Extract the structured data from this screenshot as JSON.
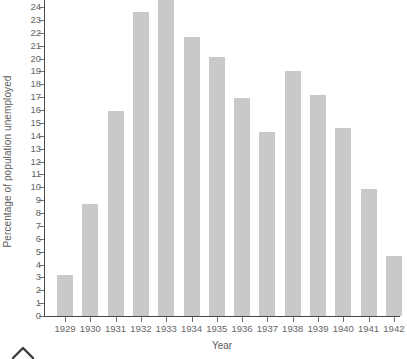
{
  "chart_data": {
    "type": "bar",
    "title": "",
    "xlabel": "Year",
    "ylabel": "Percentage of population unemployed",
    "categories": [
      "1929",
      "1930",
      "1931",
      "1932",
      "1933",
      "1934",
      "1935",
      "1936",
      "1937",
      "1938",
      "1939",
      "1940",
      "1941",
      "1942"
    ],
    "values": [
      3.2,
      8.7,
      15.9,
      23.6,
      24.9,
      21.7,
      20.1,
      16.9,
      14.3,
      19.0,
      17.2,
      14.6,
      9.9,
      4.7
    ],
    "ylim": [
      0,
      24
    ],
    "y_ticks": [
      0,
      1,
      2,
      3,
      4,
      5,
      6,
      7,
      8,
      9,
      10,
      11,
      12,
      13,
      14,
      15,
      16,
      17,
      18,
      19,
      20,
      21,
      22,
      23,
      24
    ],
    "y_tick_labels": [
      "0",
      "1",
      "2",
      "3",
      "4",
      "5",
      "6",
      "7",
      "8",
      "9",
      "10",
      "11",
      "12",
      "13",
      "14",
      "15",
      "16",
      "17",
      "18",
      "19",
      "20",
      "21",
      "22",
      "23",
      "24"
    ],
    "grid": false,
    "legend": null,
    "bar_color": "#c9c9c9",
    "axis_color": "#4a4a4a",
    "text_color": "#5c5c5c"
  },
  "axes": {
    "y_title": "Percentage of population unemployed",
    "x_title": "Year"
  },
  "icons": {
    "caret_up": "caret-up-icon"
  }
}
